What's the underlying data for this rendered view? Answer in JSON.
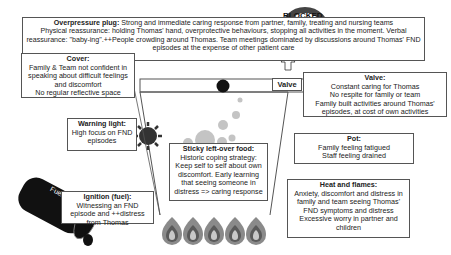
{
  "overpressure_plug": {
    "title": "Overpressure plug:",
    "line1": " Strong and immediate caring response from partner, family, treating and nursing teams",
    "line2": "Physical reassurance: holding Thomas' hand, overprotective behaviours, stopping all activities in the moment. Verbal reassurance: \"baby-ing\".++People crowding around Thomas. Team meetings dominated by discussions around Thomas' FND episodes at the expense of other patient care"
  },
  "cover": {
    "title": "Cover:",
    "lines": [
      "Family & Team not confident in speaking about difficult feelings and discomfort",
      "No regular reflective space"
    ]
  },
  "valve_label": "Valve",
  "blocked_label": "BLOCKED",
  "valve": {
    "title": "Valve:",
    "lines": [
      "Constant caring for Thomas",
      "No respite for family or team",
      "Family built activities around Thomas' episodes, at cost of own activities"
    ]
  },
  "warning_light": {
    "title": "Warning light:",
    "lines": [
      "High focus on FND episodes"
    ]
  },
  "sticky_food": {
    "title": "Sticky left-over food:",
    "lines": [
      "Historic coping strategy: Keep self to self about own discomfort. Early learning that seeing someone in distress => caring response"
    ]
  },
  "pot": {
    "title": "Pot:",
    "lines": [
      "Family feeling fatigued",
      "Staff feeling drained"
    ]
  },
  "heat_flames": {
    "title": "Heat and flames:",
    "lines": [
      "Anxiety, discomfort and distress in family and team seeing Thomas' FND symptoms and distress",
      "Excessive worry in partner and children"
    ]
  },
  "ignition": {
    "title": "Ignition (fuel):",
    "lines": [
      "Witnessing an FND episode and ++distress from Thomas"
    ]
  },
  "fuel_label": "Fuel",
  "colors": {
    "border": "#555555",
    "flame_outer": "#8a8a8a",
    "flame_mid": "#5a5a5a",
    "flame_inner": "#c8c8c8",
    "bubble": "#c4c4c4",
    "dark": "#111111"
  }
}
